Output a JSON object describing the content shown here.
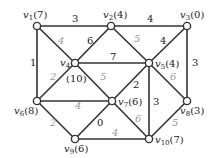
{
  "graph": {
    "nodes": [
      {
        "id": "v1",
        "label": "v1(7)",
        "x": 37,
        "y": 26,
        "lx": 23,
        "ly": 18
      },
      {
        "id": "v2",
        "label": "v2(4)",
        "x": 111,
        "y": 26,
        "lx": 103,
        "ly": 18
      },
      {
        "id": "v3",
        "label": "v3(0)",
        "x": 187,
        "y": 26,
        "lx": 180,
        "ly": 18
      },
      {
        "id": "v4",
        "label": "v4",
        "sub": "(10)",
        "x": 75,
        "y": 63,
        "lx": 60,
        "ly": 66,
        "sx": 66,
        "sy": 82
      },
      {
        "id": "v5",
        "label": "v5(4)",
        "x": 149,
        "y": 63,
        "lx": 155,
        "ly": 67
      },
      {
        "id": "v6",
        "label": "v6(8)",
        "x": 37,
        "y": 101,
        "lx": 14,
        "ly": 114
      },
      {
        "id": "v7",
        "label": "v7(6)",
        "x": 112,
        "y": 101,
        "lx": 118,
        "ly": 105
      },
      {
        "id": "v8",
        "label": "v8(3)",
        "x": 187,
        "y": 101,
        "lx": 180,
        "ly": 114
      },
      {
        "id": "v9",
        "label": "v9(6)",
        "x": 75,
        "y": 139,
        "lx": 64,
        "ly": 152
      },
      {
        "id": "v10",
        "label": "v10(7)",
        "x": 149,
        "y": 139,
        "lx": 155,
        "ly": 143
      }
    ],
    "edges": [
      {
        "from": "v1",
        "to": "v2",
        "weight": "3",
        "lx": 72,
        "ly": 22,
        "light": false
      },
      {
        "from": "v2",
        "to": "v3",
        "weight": "4",
        "lx": 147,
        "ly": 22,
        "light": false
      },
      {
        "from": "v1",
        "to": "v6",
        "weight": "1",
        "lx": 30,
        "ly": 66,
        "light": false
      },
      {
        "from": "v1",
        "to": "v4",
        "weight": "4",
        "lx": 58,
        "ly": 44,
        "light": true
      },
      {
        "from": "v2",
        "to": "v4",
        "weight": "6",
        "lx": 87,
        "ly": 44,
        "light": false
      },
      {
        "from": "v2",
        "to": "v5",
        "weight": "5",
        "lx": 134,
        "ly": 42,
        "light": true
      },
      {
        "from": "v3",
        "to": "v5",
        "weight": "4",
        "lx": 160,
        "ly": 44,
        "light": false
      },
      {
        "from": "v3",
        "to": "v8",
        "weight": "3",
        "lx": 192,
        "ly": 66,
        "light": false
      },
      {
        "from": "v4",
        "to": "v5",
        "weight": "7",
        "lx": 110,
        "ly": 60,
        "light": false
      },
      {
        "from": "v4",
        "to": "v6",
        "weight": "2",
        "lx": 50,
        "ly": 80,
        "light": true
      },
      {
        "from": "v4",
        "to": "v7",
        "weight": "5",
        "lx": 100,
        "ly": 80,
        "light": true
      },
      {
        "from": "v5",
        "to": "v7",
        "weight": "2",
        "lx": 133,
        "ly": 88,
        "light": false
      },
      {
        "from": "v5",
        "to": "v10",
        "weight": "3",
        "lx": 153,
        "ly": 105,
        "light": false
      },
      {
        "from": "v5",
        "to": "v8",
        "weight": "6",
        "lx": 170,
        "ly": 80,
        "light": true
      },
      {
        "from": "v6",
        "to": "v7",
        "weight": "4",
        "lx": 75,
        "ly": 109,
        "light": true
      },
      {
        "from": "v6",
        "to": "v9",
        "weight": "2",
        "lx": 50,
        "ly": 126,
        "light": true
      },
      {
        "from": "v7",
        "to": "v9",
        "weight": "0",
        "lx": 97,
        "ly": 126,
        "light": false
      },
      {
        "from": "v7",
        "to": "v10",
        "weight": "6",
        "lx": 135,
        "ly": 122,
        "light": true
      },
      {
        "from": "v9",
        "to": "v10",
        "weight": "4",
        "lx": 112,
        "ly": 136,
        "light": true
      },
      {
        "from": "v8",
        "to": "v10",
        "weight": "5",
        "lx": 172,
        "ly": 126,
        "light": true
      }
    ]
  }
}
